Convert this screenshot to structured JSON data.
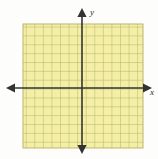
{
  "figure": {
    "title": "",
    "background_color": "#fdfdfb",
    "grid": {
      "fill_color": "#f4efa6",
      "line_color": "#b5ad62",
      "border_color": "#b5ad62",
      "columns": 14,
      "rows": 14,
      "cell_size_px": 8.6,
      "left_px": 23,
      "top_px": 24,
      "right_px": 143,
      "bottom_px": 148
    },
    "axes": {
      "color": "#333333",
      "line_width_px": 1.6,
      "origin": {
        "x_px": 82,
        "y_px": 88
      },
      "x_axis": {
        "label": "x",
        "label_x_px": 150,
        "label_y_px": 95,
        "start_px": 6,
        "end_px": 152,
        "arrow_left": true,
        "arrow_right": true
      },
      "y_axis": {
        "label": "y",
        "label_x_px": 90,
        "label_y_px": 15,
        "start_px": 8,
        "end_px": 154,
        "arrow_up": true,
        "arrow_down": true
      }
    },
    "tick_labels": [],
    "data_points": [],
    "curves": []
  },
  "chart_data": {
    "type": "scatter",
    "title": "",
    "xlabel": "x",
    "ylabel": "y",
    "x": [],
    "y": [],
    "xlim": [
      -7,
      7
    ],
    "ylim": [
      -7,
      7
    ],
    "grid": true,
    "legend": "none"
  }
}
